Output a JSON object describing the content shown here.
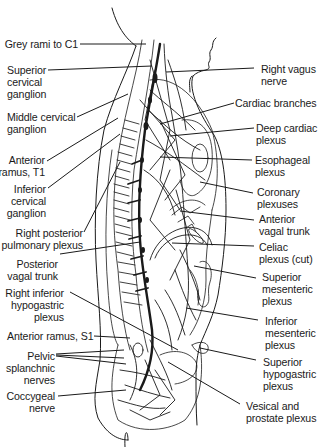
{
  "figure": {
    "colors": {
      "ink": "#1a1a1a",
      "background": "#ffffff",
      "shade": "#bdbdbd"
    }
  },
  "labels_left": [
    {
      "id": "grey-rami-c1",
      "text": "Grey rami to C1"
    },
    {
      "id": "superior-cervical-ganglion",
      "text": "Superior\ncervical\nganglion"
    },
    {
      "id": "middle-cervical-ganglion",
      "text": "Middle cervical\nganglion"
    },
    {
      "id": "anterior-ramus-t1",
      "text": "Anterior\nramus, T1"
    },
    {
      "id": "inferior-cervical-ganglion",
      "text": "Inferior\ncervical\nganglion"
    },
    {
      "id": "right-posterior-pulmonary-plexus",
      "text": "Right posterior\npulmonary plexus"
    },
    {
      "id": "posterior-vagal-trunk",
      "text": "Posterior\nvagal trunk"
    },
    {
      "id": "right-inferior-hypogastric-plexus",
      "text": "Right inferior\nhypogastric\nplexus"
    },
    {
      "id": "anterior-ramus-s1",
      "text": "Anterior ramus, S1"
    },
    {
      "id": "pelvic-splanchnic-nerves",
      "text": "Pelvic\nsplanchnic\nnerves"
    },
    {
      "id": "coccygeal-nerve",
      "text": "Coccygeal\nnerve"
    }
  ],
  "labels_right": [
    {
      "id": "right-vagus-nerve",
      "text": "Right vagus\nnerve"
    },
    {
      "id": "cardiac-branches",
      "text": "Cardiac branches"
    },
    {
      "id": "deep-cardiac-plexus",
      "text": "Deep cardiac\nplexus"
    },
    {
      "id": "esophageal-plexus",
      "text": "Esophageal\nplexus"
    },
    {
      "id": "coronary-plexuses",
      "text": "Coronary\nplexuses"
    },
    {
      "id": "anterior-vagal-trunk",
      "text": "Anterior\nvagal trunk"
    },
    {
      "id": "celiac-plexus-cut",
      "text": "Celiac\nplexus (cut)"
    },
    {
      "id": "superior-mesenteric-plexus",
      "text": "Superior\nmesenteric\nplexus"
    },
    {
      "id": "inferior-mesenteric-plexus",
      "text": "Inferior\nmesenteric\nplexus"
    },
    {
      "id": "superior-hypogastric-plexus",
      "text": "Superior\nhypogastric\nplexus"
    },
    {
      "id": "vesical-prostate-plexus",
      "text": "Vesical and\nprostate plexus"
    }
  ]
}
